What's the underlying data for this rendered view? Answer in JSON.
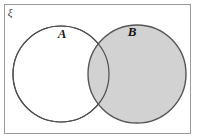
{
  "figure": {
    "kind": "venn-diagram",
    "width": 198,
    "height": 138,
    "background_color": "#ffffff",
    "universal_set": {
      "symbol": "ξ",
      "name": "universal-set-symbol",
      "x": 10,
      "y": 16
    },
    "frame": {
      "x": 4.5,
      "y": 4.5,
      "width": 186,
      "height": 129,
      "stroke": "#9a9a9a",
      "stroke_width": 1,
      "fill": "#ffffff"
    },
    "sets": [
      {
        "label": "A",
        "name": "set-a",
        "cx": 61,
        "cy": 74,
        "r": 48,
        "fill": "#ffffff",
        "stroke": "#4d4d4d",
        "stroke_width": 1.2,
        "shaded": false,
        "label_x": 62,
        "label_y": 38
      },
      {
        "label": "B",
        "name": "set-b",
        "cx": 137,
        "cy": 74,
        "r": 49,
        "fill": "#d2d2d2",
        "stroke": "#555555",
        "stroke_width": 1.4,
        "shaded": true,
        "label_x": 132,
        "label_y": 36
      }
    ],
    "shading": {
      "region": "B",
      "description": "Set B shaded entirely, including the intersection A∩B",
      "color": "#d2d2d2"
    }
  }
}
